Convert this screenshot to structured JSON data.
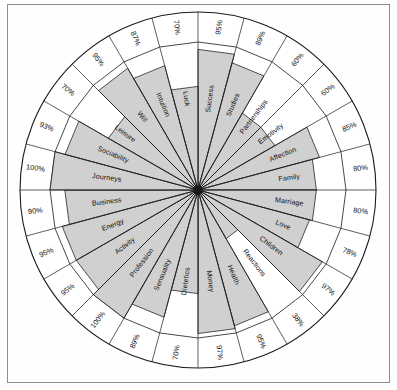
{
  "page": {
    "frame_border_color": "#8d8d8d",
    "background_color": "#ffffff",
    "fill_color": "#c8c8c8",
    "line_color": "#1a1a1a"
  },
  "chart_data": {
    "type": "bar",
    "subtype": "radial-wheel",
    "title": "",
    "xlabel": "",
    "ylabel": "",
    "ylim": [
      0,
      100
    ],
    "value_suffix": "%",
    "grid": false,
    "legend": "none",
    "categories": [
      "Success",
      "Studies",
      "Partnerships",
      "Emotivity",
      "Affection",
      "Family",
      "Marriage",
      "Love",
      "Children",
      "Reactions",
      "Health",
      "Money",
      "Dietetics",
      "Sensuality",
      "Profession",
      "Activity",
      "Energy",
      "Business",
      "Journeys",
      "Sociability",
      "Leisure",
      "Will",
      "Intuition",
      "Luck"
    ],
    "values": [
      95,
      89,
      60,
      60,
      85,
      80,
      80,
      78,
      97,
      38,
      95,
      97,
      70,
      89,
      100,
      95,
      95,
      90,
      100,
      93,
      70,
      95,
      87,
      70
    ],
    "labels": [
      "95%",
      "89%",
      "60%",
      "60%",
      "85%",
      "80%",
      "80%",
      "78%",
      "97%",
      "38%",
      "95%",
      "97%",
      "70%",
      "89%",
      "100%",
      "95%",
      "95%",
      "90%",
      "100%",
      "93%",
      "70%",
      "95%",
      "87%",
      "70%"
    ]
  }
}
